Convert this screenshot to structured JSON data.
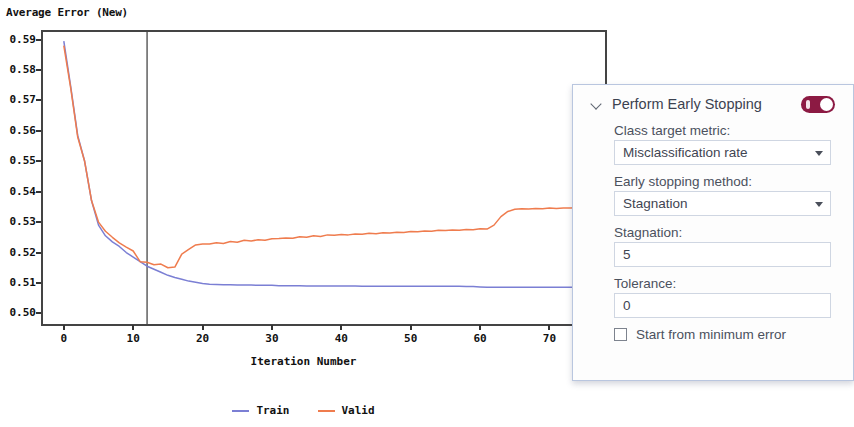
{
  "chart_data": {
    "type": "line",
    "title": "Average Error (New)",
    "xlabel": "Iteration Number",
    "ylabel": "",
    "xlim": [
      -3,
      78
    ],
    "ylim": [
      0.4965,
      0.5925
    ],
    "xticks": [
      0,
      10,
      20,
      30,
      40,
      50,
      60,
      70
    ],
    "xtick_labels": [
      "0",
      "10",
      "20",
      "30",
      "40",
      "50",
      "60",
      "70"
    ],
    "yticks": [
      0.5,
      0.51,
      0.52,
      0.53,
      0.54,
      0.55,
      0.56,
      0.57,
      0.58,
      0.59
    ],
    "ytick_labels": [
      "0.50",
      "0.51",
      "0.52",
      "0.53",
      "0.54",
      "0.55",
      "0.56",
      "0.57",
      "0.58",
      "0.59"
    ],
    "grid": false,
    "legend_position": "bottom-center",
    "annotations": [
      {
        "type": "vline",
        "x": 12,
        "label": "early stopping iteration",
        "color": "#555555"
      }
    ],
    "series": [
      {
        "name": "Train",
        "color": "#7b7fd4",
        "x": [
          0,
          1,
          2,
          3,
          4,
          5,
          6,
          7,
          8,
          9,
          10,
          11,
          12,
          13,
          14,
          15,
          16,
          17,
          18,
          19,
          20,
          21,
          22,
          23,
          24,
          25,
          26,
          27,
          28,
          29,
          30,
          31,
          32,
          33,
          34,
          35,
          36,
          37,
          38,
          39,
          40,
          41,
          42,
          43,
          44,
          45,
          46,
          47,
          48,
          49,
          50,
          51,
          52,
          53,
          54,
          55,
          56,
          57,
          58,
          59,
          60,
          61,
          62,
          63,
          64,
          65,
          66,
          67,
          68,
          69,
          70,
          71,
          72,
          73,
          74,
          75
        ],
        "values": [
          0.5895,
          0.5745,
          0.5585,
          0.55,
          0.537,
          0.529,
          0.5255,
          0.5235,
          0.522,
          0.52,
          0.5185,
          0.517,
          0.5155,
          0.5145,
          0.5135,
          0.5125,
          0.5118,
          0.5112,
          0.5106,
          0.5102,
          0.5098,
          0.5096,
          0.5095,
          0.5094,
          0.5094,
          0.5093,
          0.5093,
          0.5093,
          0.5092,
          0.5092,
          0.5092,
          0.5091,
          0.5091,
          0.5091,
          0.5091,
          0.509,
          0.509,
          0.509,
          0.509,
          0.509,
          0.509,
          0.509,
          0.509,
          0.5089,
          0.5089,
          0.5089,
          0.5089,
          0.5089,
          0.5089,
          0.5089,
          0.5089,
          0.5089,
          0.5089,
          0.5089,
          0.5089,
          0.5089,
          0.5089,
          0.5089,
          0.5088,
          0.5088,
          0.5087,
          0.5086,
          0.5086,
          0.5086,
          0.5086,
          0.5086,
          0.5086,
          0.5086,
          0.5086,
          0.5086,
          0.5086,
          0.5086,
          0.5086,
          0.5086,
          0.5086,
          0.5086
        ]
      },
      {
        "name": "Valid",
        "color": "#ef7c4e",
        "x": [
          0,
          1,
          2,
          3,
          4,
          5,
          6,
          7,
          8,
          9,
          10,
          11,
          12,
          13,
          14,
          15,
          16,
          17,
          18,
          19,
          20,
          21,
          22,
          23,
          24,
          25,
          26,
          27,
          28,
          29,
          30,
          31,
          32,
          33,
          34,
          35,
          36,
          37,
          38,
          39,
          40,
          41,
          42,
          43,
          44,
          45,
          46,
          47,
          48,
          49,
          50,
          51,
          52,
          53,
          54,
          55,
          56,
          57,
          58,
          59,
          60,
          61,
          62,
          63,
          64,
          65,
          66,
          67,
          68,
          69,
          70,
          71,
          72,
          73,
          74,
          75
        ],
        "values": [
          0.588,
          0.574,
          0.558,
          0.55,
          0.537,
          0.53,
          0.527,
          0.525,
          0.5232,
          0.5218,
          0.5205,
          0.517,
          0.5168,
          0.516,
          0.5162,
          0.515,
          0.5152,
          0.5195,
          0.521,
          0.5225,
          0.5228,
          0.5228,
          0.5232,
          0.523,
          0.5236,
          0.5234,
          0.524,
          0.5238,
          0.5242,
          0.524,
          0.5245,
          0.5246,
          0.5248,
          0.5247,
          0.5252,
          0.525,
          0.5255,
          0.5253,
          0.5258,
          0.5257,
          0.5259,
          0.5258,
          0.5261,
          0.526,
          0.5263,
          0.5262,
          0.5265,
          0.5264,
          0.5267,
          0.5266,
          0.5269,
          0.5268,
          0.5271,
          0.527,
          0.5273,
          0.5272,
          0.5274,
          0.5273,
          0.5276,
          0.5275,
          0.5278,
          0.5277,
          0.529,
          0.5318,
          0.5335,
          0.5342,
          0.5344,
          0.5343,
          0.5345,
          0.5344,
          0.5346,
          0.5345,
          0.5346,
          0.5346,
          0.5347,
          0.5347
        ]
      }
    ]
  },
  "panel": {
    "title": "Perform Early Stopping",
    "collapse_icon": "chevron-down-icon",
    "toggle_state": "on",
    "toggle_color": "#8c1a43",
    "fields": [
      {
        "label": "Class target metric:",
        "value": "Misclassification rate",
        "control": "dropdown"
      },
      {
        "label": "Early stopping method:",
        "value": "Stagnation",
        "control": "dropdown"
      },
      {
        "label": "Stagnation:",
        "value": "5",
        "control": "text"
      },
      {
        "label": "Tolerance:",
        "value": "0",
        "control": "text"
      }
    ],
    "checkbox": {
      "label": "Start from minimum error",
      "checked": false
    }
  }
}
